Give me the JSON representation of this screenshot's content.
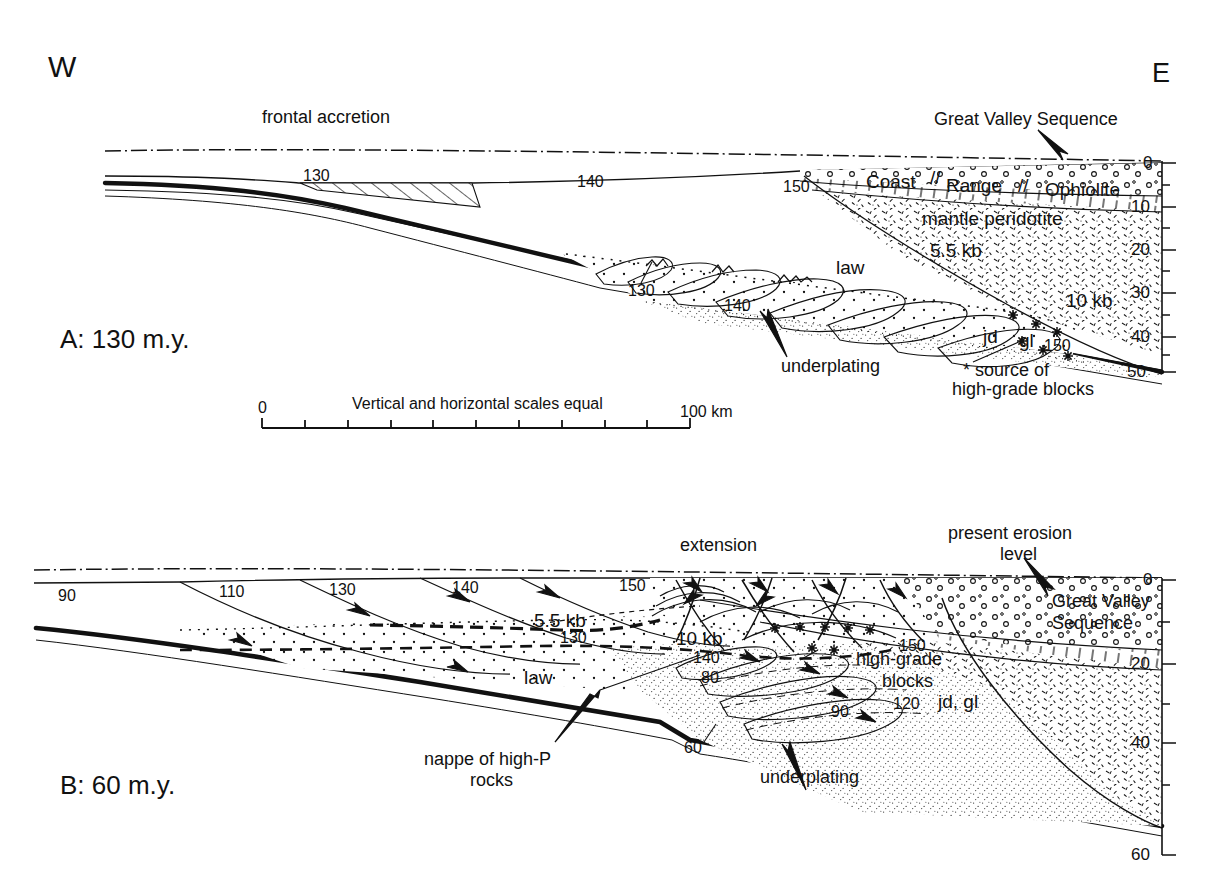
{
  "figure": {
    "type": "geologic-cross-section",
    "orientation_left": "W",
    "orientation_right": "E",
    "background": "#ffffff",
    "ink": "#111111"
  },
  "scale_bar": {
    "caption": "Vertical and horizontal scales equal",
    "start_label": "0",
    "end_label": "100 km",
    "divisions": 10
  },
  "panels": [
    {
      "id": "A",
      "title": "A: 130 m.y.",
      "depth_axis": {
        "unit": "km",
        "ticks": [
          "0",
          "10",
          "20",
          "30",
          "40",
          "50"
        ]
      },
      "labels": {
        "frontal_accretion": "frontal accretion",
        "great_valley_sequence": "Great Valley Sequence",
        "coast_range_ophiolite": "Coast // Range //Ophiolite",
        "coast": "Coast",
        "range": "Range",
        "ophiolite": "Ophiolite",
        "mantle_peridotite": "mantle peridotite",
        "pressure_shallow": "5.5 kb",
        "pressure_deep": "10 kb",
        "lawsonite": "law",
        "jadeite_glaucophane_jd": "jd",
        "jadeite_glaucophane_gl": "gl",
        "underplating": "underplating",
        "source_line1": "* source of",
        "source_line2": "high-grade blocks"
      },
      "isochrons": [
        "130",
        "140",
        "150",
        "130",
        "140",
        "150"
      ],
      "isochron_positions": [
        {
          "value": "130",
          "x": 310,
          "y": 176
        },
        {
          "value": "140",
          "x": 583,
          "y": 182
        },
        {
          "value": "150",
          "x": 789,
          "y": 187
        },
        {
          "value": "130",
          "x": 636,
          "y": 290
        },
        {
          "value": "140",
          "x": 731,
          "y": 306
        },
        {
          "value": "150",
          "x": 1052,
          "y": 345
        }
      ]
    },
    {
      "id": "B",
      "title": "B: 60 m.y.",
      "depth_axis": {
        "unit": "km",
        "ticks": [
          "0",
          "20",
          "40",
          "60"
        ]
      },
      "labels": {
        "extension": "extension",
        "present_erosion_line1": "present erosion",
        "present_erosion_line2": "level",
        "great_valley_line1": "Great Valley",
        "great_valley_line2": "Sequence",
        "pressure_shallow": "5.5 kb",
        "pressure_deep": "10 kb",
        "lawsonite": "law",
        "high_grade_line1": "high-grade",
        "high_grade_line2": "blocks",
        "jadeite_glaucophane": "jd, gl",
        "nappe_line1": "nappe of high-P",
        "nappe_line2": "rocks",
        "underplating": "underplating"
      },
      "isochron_positions": [
        {
          "value": "90",
          "x": 65,
          "y": 596
        },
        {
          "value": "110",
          "x": 226,
          "y": 592
        },
        {
          "value": "130",
          "x": 336,
          "y": 589
        },
        {
          "value": "140",
          "x": 459,
          "y": 587
        },
        {
          "value": "150",
          "x": 626,
          "y": 585
        },
        {
          "value": "130",
          "x": 567,
          "y": 637
        },
        {
          "value": "140",
          "x": 700,
          "y": 658
        },
        {
          "value": "80",
          "x": 708,
          "y": 678
        },
        {
          "value": "90",
          "x": 838,
          "y": 712
        },
        {
          "value": "120",
          "x": 900,
          "y": 704
        },
        {
          "value": "150",
          "x": 906,
          "y": 646
        },
        {
          "value": "60",
          "x": 691,
          "y": 748
        }
      ]
    }
  ]
}
